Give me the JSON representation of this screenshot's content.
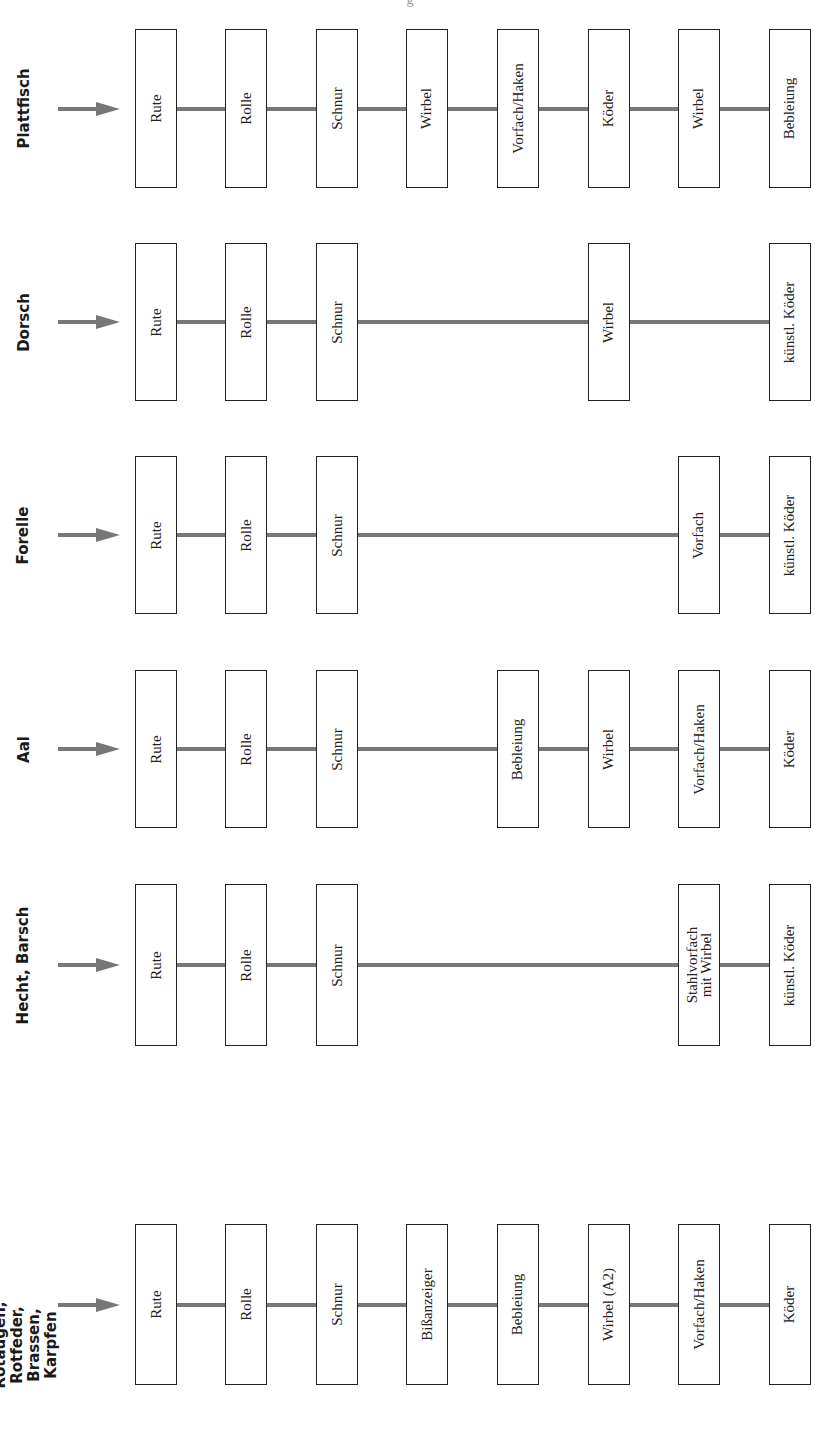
{
  "header": {
    "partial_text": "g"
  },
  "colors": {
    "line": "#777777",
    "arrow": "#777777",
    "box_border": "#222222"
  },
  "rows": [
    {
      "label": "Plattfisch",
      "items": [
        {
          "col": 0,
          "label": "Rute"
        },
        {
          "col": 1,
          "label": "Rolle"
        },
        {
          "col": 2,
          "label": "Schnur"
        },
        {
          "col": 3,
          "label": "Wirbel"
        },
        {
          "col": 4,
          "label": "Vorfach/Haken"
        },
        {
          "col": 5,
          "label": "Köder"
        },
        {
          "col": 6,
          "label": "Wirbel"
        },
        {
          "col": 7,
          "label": "Bebleiung"
        }
      ]
    },
    {
      "label": "Dorsch",
      "items": [
        {
          "col": 0,
          "label": "Rute"
        },
        {
          "col": 1,
          "label": "Rolle"
        },
        {
          "col": 2,
          "label": "Schnur"
        },
        {
          "col": 5,
          "label": "Wirbel"
        },
        {
          "col": 7,
          "label": "künstl. Köder"
        }
      ]
    },
    {
      "label": "Forelle",
      "items": [
        {
          "col": 0,
          "label": "Rute"
        },
        {
          "col": 1,
          "label": "Rolle"
        },
        {
          "col": 2,
          "label": "Schnur"
        },
        {
          "col": 6,
          "label": "Vorfach"
        },
        {
          "col": 7,
          "label": "künstl. Köder"
        }
      ]
    },
    {
      "label": "Aal",
      "items": [
        {
          "col": 0,
          "label": "Rute"
        },
        {
          "col": 1,
          "label": "Rolle"
        },
        {
          "col": 2,
          "label": "Schnur"
        },
        {
          "col": 4,
          "label": "Bebleiung"
        },
        {
          "col": 5,
          "label": "Wirbel"
        },
        {
          "col": 6,
          "label": "Vorfach/Haken"
        },
        {
          "col": 7,
          "label": "Köder"
        }
      ]
    },
    {
      "label": "Hecht, Barsch",
      "items": [
        {
          "col": 0,
          "label": "Rute"
        },
        {
          "col": 1,
          "label": "Rolle"
        },
        {
          "col": 2,
          "label": "Schnur"
        },
        {
          "col": 6,
          "label": "Stahlvorfach mit Wirbel"
        },
        {
          "col": 7,
          "label": "künstl. Köder"
        }
      ]
    },
    {
      "label": "Rotaugen, Rotfeder, Brassen, Karpfen",
      "items": [
        {
          "col": 0,
          "label": "Rute"
        },
        {
          "col": 1,
          "label": "Rolle"
        },
        {
          "col": 2,
          "label": "Schnur"
        },
        {
          "col": 3,
          "label": "Bißanzeiger"
        },
        {
          "col": 4,
          "label": "Bebleiung"
        },
        {
          "col": 5,
          "label": "Wirbel (A2)"
        },
        {
          "col": 6,
          "label": "Vorfach/Haken"
        },
        {
          "col": 7,
          "label": "Köder"
        }
      ]
    }
  ]
}
